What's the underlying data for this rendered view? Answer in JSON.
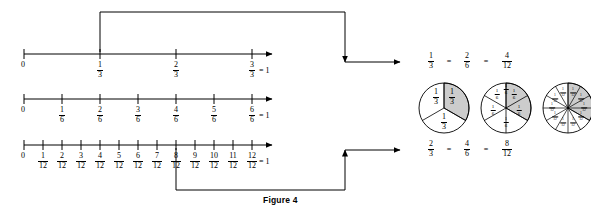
{
  "caption": "Figure 4",
  "colors": {
    "line": "#000000",
    "shade": "#cccccc",
    "white": "#ffffff"
  },
  "number_lines": [
    {
      "name": "thirds",
      "start_label": "0",
      "end_label": "= 1",
      "denominator": "3",
      "ticks": [
        "1",
        "2",
        "3"
      ]
    },
    {
      "name": "sixths",
      "start_label": "0",
      "end_label": "= 1",
      "denominator": "6",
      "ticks": [
        "1",
        "2",
        "3",
        "4",
        "5",
        "6"
      ]
    },
    {
      "name": "twelfths",
      "start_label": "0",
      "end_label": "= 1",
      "denominator": "12",
      "ticks": [
        "1",
        "2",
        "3",
        "4",
        "5",
        "6",
        "7",
        "8",
        "9",
        "10",
        "11",
        "12"
      ]
    }
  ],
  "equations": [
    {
      "name": "one-third-row",
      "terms": [
        {
          "num": "1",
          "den": "3"
        },
        {
          "num": "2",
          "den": "6"
        },
        {
          "num": "4",
          "den": "12"
        }
      ],
      "equals": [
        "=",
        "="
      ]
    },
    {
      "name": "two-thirds-row",
      "terms": [
        {
          "num": "2",
          "den": "3"
        },
        {
          "num": "4",
          "den": "6"
        },
        {
          "num": "8",
          "den": "12"
        }
      ],
      "equals": [
        "=",
        "="
      ]
    }
  ],
  "pies": [
    {
      "name": "pie-thirds",
      "slices": 3,
      "shaded": 1,
      "labels": [
        {
          "num": "1",
          "den": "3"
        },
        {
          "num": "1",
          "den": "3"
        },
        {
          "num": "1",
          "den": "3"
        }
      ]
    },
    {
      "name": "pie-sixths",
      "slices": 6,
      "shaded": 2,
      "labels": [
        {
          "num": "1",
          "den": "6"
        },
        {
          "num": "1",
          "den": "6"
        },
        {
          "num": "1",
          "den": "6"
        },
        {
          "num": "1",
          "den": "6"
        },
        {
          "num": "1",
          "den": "6"
        },
        {
          "num": "1",
          "den": "6"
        }
      ]
    },
    {
      "name": "pie-twelfths",
      "slices": 12,
      "shaded": 4,
      "labels": [
        {
          "num": "1",
          "den": "12"
        },
        {
          "num": "1",
          "den": "12"
        },
        {
          "num": "1",
          "den": "12"
        },
        {
          "num": "1",
          "den": "12"
        },
        {
          "num": "1",
          "den": "12"
        },
        {
          "num": "1",
          "den": "12"
        },
        {
          "num": "1",
          "den": "12"
        },
        {
          "num": "1",
          "den": "12"
        },
        {
          "num": "1",
          "den": "12"
        },
        {
          "num": "1",
          "den": "12"
        },
        {
          "num": "1",
          "den": "12"
        },
        {
          "num": "1",
          "den": "12"
        }
      ]
    }
  ]
}
